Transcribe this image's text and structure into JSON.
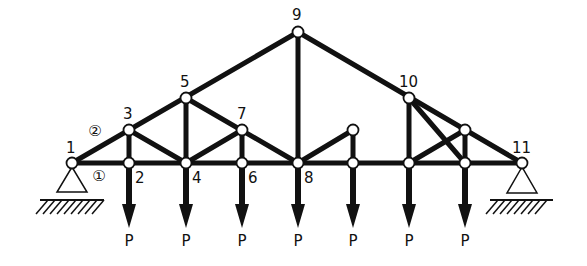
{
  "diagram": {
    "type": "truss",
    "colors": {
      "member": "#111111",
      "node_fill": "#ffffff",
      "background": "#ffffff"
    },
    "nodes": [
      {
        "id": "1",
        "x": 72,
        "y": 163,
        "label": "1",
        "lx": 66,
        "ly": 153
      },
      {
        "id": "2",
        "x": 129,
        "y": 163,
        "label": "2",
        "lx": 135,
        "ly": 183
      },
      {
        "id": "3",
        "x": 129,
        "y": 130,
        "label": "3",
        "lx": 123,
        "ly": 119
      },
      {
        "id": "4",
        "x": 186,
        "y": 163,
        "label": "4",
        "lx": 192,
        "ly": 183
      },
      {
        "id": "5",
        "x": 186,
        "y": 98,
        "label": "5",
        "lx": 180,
        "ly": 87
      },
      {
        "id": "6",
        "x": 242,
        "y": 163,
        "label": "6",
        "lx": 248,
        "ly": 183
      },
      {
        "id": "7",
        "x": 242,
        "y": 130,
        "label": "7",
        "lx": 237,
        "ly": 119
      },
      {
        "id": "8",
        "x": 298,
        "y": 163,
        "label": "8",
        "lx": 304,
        "ly": 183
      },
      {
        "id": "9",
        "x": 298,
        "y": 32,
        "label": "9",
        "lx": 292,
        "ly": 20
      },
      {
        "id": "a",
        "x": 353,
        "y": 163,
        "label": ""
      },
      {
        "id": "b",
        "x": 353,
        "y": 130,
        "label": ""
      },
      {
        "id": "c",
        "x": 409,
        "y": 163,
        "label": ""
      },
      {
        "id": "10",
        "x": 409,
        "y": 98,
        "label": "10",
        "lx": 399,
        "ly": 87
      },
      {
        "id": "d",
        "x": 465,
        "y": 163,
        "label": ""
      },
      {
        "id": "e",
        "x": 465,
        "y": 130,
        "label": ""
      },
      {
        "id": "11",
        "x": 522,
        "y": 163,
        "label": "11",
        "lx": 512,
        "ly": 153
      }
    ],
    "members": [
      [
        "1",
        "11"
      ],
      [
        "1",
        "9"
      ],
      [
        "9",
        "11"
      ],
      [
        "3",
        "2"
      ],
      [
        "5",
        "4"
      ],
      [
        "7",
        "6"
      ],
      [
        "9",
        "8"
      ],
      [
        "b",
        "a"
      ],
      [
        "10",
        "c"
      ],
      [
        "e",
        "d"
      ],
      [
        "3",
        "4"
      ],
      [
        "5",
        "8"
      ],
      [
        "4",
        "7"
      ],
      [
        "8",
        "b"
      ],
      [
        "10",
        "d"
      ],
      [
        "c",
        "e"
      ]
    ],
    "member_labels": [
      {
        "text": "①",
        "x": 99,
        "y": 181
      },
      {
        "text": "②",
        "x": 95,
        "y": 136
      }
    ],
    "loads": {
      "label": "P",
      "at_x": [
        129,
        186,
        242,
        298,
        353,
        409,
        465
      ],
      "from_y": 163,
      "tip_y": 228,
      "label_y": 246
    },
    "supports": [
      {
        "type": "pin",
        "x": 72,
        "y": 163,
        "base_half": 15,
        "base_y": 192,
        "ground_y": 200,
        "ground_x1": 40,
        "ground_x2": 104
      },
      {
        "type": "pin",
        "x": 522,
        "y": 163,
        "base_half": 15,
        "base_y": 193,
        "ground_y": 200,
        "ground_x1": 490,
        "ground_x2": 553
      }
    ]
  }
}
